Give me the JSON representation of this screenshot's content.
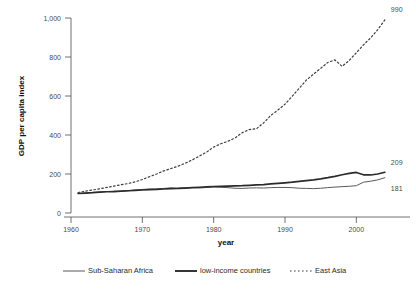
{
  "chart_data": {
    "type": "line",
    "title": "",
    "xlabel": "year",
    "ylabel": "GDP per capita index",
    "xlim": [
      1960,
      2005
    ],
    "ylim": [
      0,
      1000
    ],
    "xticks": [
      1960,
      1970,
      1980,
      1990,
      2000
    ],
    "xticklabels": [
      "1960",
      "1970",
      "1980",
      "1990",
      "2000"
    ],
    "yticks": [
      0,
      200,
      400,
      600,
      800,
      1000
    ],
    "yticklabels": [
      "0",
      "200",
      "400",
      "600",
      "800",
      "1,000"
    ],
    "grid": false,
    "legend_position": "bottom",
    "series": [
      {
        "name": "Sub-Saharan Africa",
        "style": "solid-thin",
        "color": "#595959",
        "width": 1.0,
        "end_label": "181",
        "x": [
          1961,
          1962,
          1963,
          1964,
          1965,
          1966,
          1967,
          1968,
          1969,
          1970,
          1971,
          1972,
          1973,
          1974,
          1975,
          1976,
          1977,
          1978,
          1979,
          1980,
          1981,
          1982,
          1983,
          1984,
          1985,
          1986,
          1987,
          1988,
          1989,
          1990,
          1991,
          1992,
          1993,
          1994,
          1995,
          1996,
          1997,
          1998,
          1999,
          2000,
          2001,
          2002,
          2003,
          2004
        ],
        "y": [
          100,
          102,
          105,
          107,
          110,
          112,
          111,
          114,
          118,
          121,
          123,
          124,
          126,
          129,
          127,
          129,
          130,
          128,
          131,
          133,
          132,
          130,
          127,
          126,
          128,
          129,
          128,
          130,
          131,
          131,
          130,
          127,
          126,
          125,
          127,
          130,
          133,
          135,
          137,
          140,
          158,
          163,
          170,
          181
        ],
        "label_y": 181
      },
      {
        "name": "low-income countries",
        "style": "solid-thick",
        "color": "#2b2b2b",
        "width": 1.7,
        "end_label": "209",
        "x": [
          1961,
          1962,
          1963,
          1964,
          1965,
          1966,
          1967,
          1968,
          1969,
          1970,
          1971,
          1972,
          1973,
          1974,
          1975,
          1976,
          1977,
          1978,
          1979,
          1980,
          1981,
          1982,
          1983,
          1984,
          1985,
          1986,
          1987,
          1988,
          1989,
          1990,
          1991,
          1992,
          1993,
          1994,
          1995,
          1996,
          1997,
          1998,
          1999,
          2000,
          2001,
          2002,
          2003,
          2004
        ],
        "y": [
          100,
          102,
          104,
          107,
          109,
          110,
          112,
          114,
          116,
          118,
          120,
          121,
          123,
          125,
          126,
          128,
          130,
          132,
          134,
          136,
          137,
          138,
          139,
          140,
          142,
          144,
          146,
          149,
          152,
          155,
          158,
          162,
          166,
          170,
          175,
          181,
          188,
          196,
          203,
          208,
          196,
          195,
          200,
          209
        ],
        "label_y": 209
      },
      {
        "name": "East Asia",
        "style": "dotted",
        "color": "#3d3d3d",
        "width": 1.2,
        "end_label": "990",
        "x": [
          1961,
          1962,
          1963,
          1964,
          1965,
          1966,
          1967,
          1968,
          1969,
          1970,
          1971,
          1972,
          1973,
          1974,
          1975,
          1976,
          1977,
          1978,
          1979,
          1980,
          1981,
          1982,
          1983,
          1984,
          1985,
          1986,
          1987,
          1988,
          1989,
          1990,
          1991,
          1992,
          1993,
          1994,
          1995,
          1996,
          1997,
          1998,
          1999,
          2000,
          2001,
          2002,
          2003,
          2004
        ],
        "y": [
          105,
          112,
          118,
          124,
          131,
          138,
          145,
          151,
          160,
          172,
          186,
          200,
          216,
          228,
          240,
          255,
          272,
          292,
          312,
          338,
          355,
          368,
          385,
          412,
          428,
          432,
          462,
          500,
          528,
          558,
          598,
          640,
          682,
          712,
          742,
          772,
          785,
          752,
          782,
          822,
          862,
          898,
          940,
          990
        ],
        "label_y": 990
      }
    ],
    "endpoint_labels": [
      {
        "text": "990",
        "value": 990,
        "series": "East Asia"
      },
      {
        "text": "209",
        "value": 209,
        "series": "low-income countries"
      },
      {
        "text": "181",
        "value": 181,
        "series": "Sub-Saharan Africa"
      }
    ],
    "legend": [
      {
        "label": "Sub-Saharan Africa",
        "style": "solid-thin",
        "color": "#595959"
      },
      {
        "label": "low-income countries",
        "style": "solid-thick",
        "color": "#2b2b2b"
      },
      {
        "label": "East Asia",
        "style": "dotted",
        "color": "#3d3d3d"
      }
    ]
  }
}
